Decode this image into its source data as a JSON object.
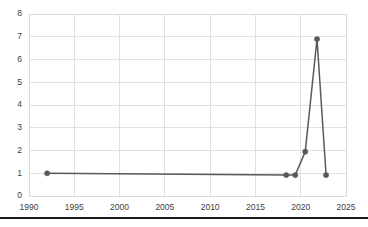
{
  "chart_data": {
    "type": "line",
    "title": "",
    "subtitle": "",
    "xlabel": "",
    "ylabel": "",
    "xlim": [
      1990,
      2025
    ],
    "ylim": [
      0,
      8
    ],
    "grid": true,
    "legend": false,
    "legend_position": "none",
    "x_ticks": [
      1990,
      1995,
      2000,
      2005,
      2010,
      2015,
      2020,
      2025
    ],
    "x_tick_labels": [
      "1990",
      "1995",
      "2000",
      "2005",
      "2010",
      "2015",
      "2020",
      "2025"
    ],
    "y_ticks": [
      0,
      1,
      2,
      3,
      4,
      5,
      6,
      7,
      8
    ],
    "y_tick_labels": [
      "0",
      "1",
      "2",
      "3",
      "4",
      "5",
      "6",
      "7",
      "8"
    ],
    "series": [
      {
        "name": "series-1",
        "color": "#595959",
        "marker": "circle",
        "x": [
          1992.0,
          2018.4,
          2019.4,
          2020.5,
          2021.8,
          2022.8
        ],
        "y": [
          1.0,
          0.92,
          0.92,
          1.95,
          6.9,
          0.92
        ]
      }
    ],
    "annotations": []
  },
  "style": {
    "background": "#ffffff",
    "grid_color": "#d9d9d9",
    "series_color": "#595959",
    "tick_text_color": "#404040",
    "bottom_rule_color": "#1a1a1a"
  },
  "layout": {
    "plot_left": 29,
    "plot_right": 346,
    "plot_top": 14,
    "plot_bottom": 196,
    "bottom_rule_y": 218
  }
}
